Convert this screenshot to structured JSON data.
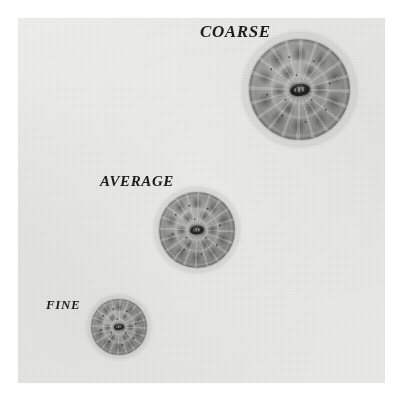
{
  "figure": {
    "background_color": "#e9e9e7",
    "page_color": "#ffffff",
    "label_color": "#1d1d1b",
    "specimens": [
      {
        "label": "COARSE",
        "rank": 1,
        "relative_diameter": 113,
        "medulla": "present",
        "description": "largest fibre cross-section with coarse cuticle cell mosaic and central dark medulla"
      },
      {
        "label": "AVERAGE",
        "rank": 2,
        "relative_diameter": 84,
        "medulla": "present",
        "description": "medium fibre cross-section with cuticle cell mosaic and central dark medulla"
      },
      {
        "label": "FINE",
        "rank": 3,
        "relative_diameter": 62,
        "medulla": "present",
        "description": "smallest fibre cross-section with fine cuticle cell mosaic and central dark medulla"
      }
    ]
  }
}
